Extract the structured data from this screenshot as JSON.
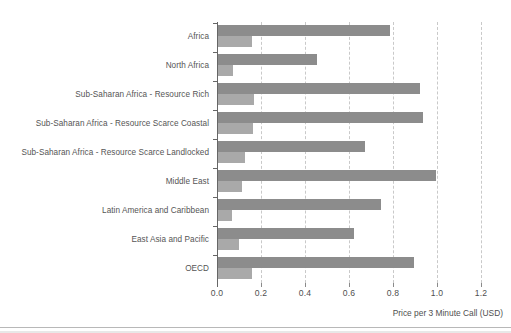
{
  "chart_data": {
    "type": "bar",
    "orientation": "horizontal",
    "title": "",
    "subtitle": "",
    "xlabel": "Price per 3 Minute Call (USD)",
    "ylabel": "",
    "xlim": [
      0.0,
      1.2
    ],
    "xticks": [
      "0.0",
      "0.2",
      "0.4",
      "0.6",
      "0.8",
      "1.0",
      "1.2"
    ],
    "xtick_values": [
      0.0,
      0.2,
      0.4,
      0.6,
      0.8,
      1.0,
      1.2
    ],
    "grid": "vertical-dashed",
    "legend": "none",
    "categories": [
      "Africa",
      "North Africa",
      "Sub-Saharan Africa - Resource Rich",
      "Sub-Saharan Africa - Resource Scarce Coastal",
      "Sub-Saharan Africa - Resource Scarce Landlocked",
      "Middle East",
      "Latin America and Caribbean",
      "East Asia and Pacific",
      "OECD"
    ],
    "series": [
      {
        "name": "series-1",
        "color": "#8c8c8c",
        "values": [
          0.78,
          0.45,
          0.92,
          0.93,
          0.67,
          0.99,
          0.74,
          0.62,
          0.89
        ]
      },
      {
        "name": "series-2",
        "color": "#a9a9a9",
        "values": [
          0.155,
          0.068,
          0.162,
          0.158,
          0.123,
          0.11,
          0.062,
          0.094,
          0.155
        ]
      }
    ]
  },
  "axis": {
    "x_title": "Price per 3 Minute Call (USD)"
  },
  "colors": {
    "series_1": "#8c8c8c",
    "series_2": "#a9a9a9",
    "gridline": "#c9c9c9",
    "axis": "#666666",
    "label_text": "#555555",
    "background": "#ffffff"
  }
}
